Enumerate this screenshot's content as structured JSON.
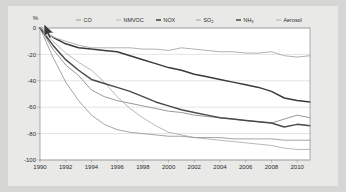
{
  "chart_data": {
    "type": "line",
    "title": "",
    "subtitle": "",
    "xlabel": "",
    "ylabel": "%",
    "ylim": [
      -100,
      0
    ],
    "xlim": [
      1990,
      2011
    ],
    "grid": true,
    "legend_position": "top",
    "y_ticks": [
      "0",
      "-20",
      "-40",
      "-60",
      "-80",
      "-100"
    ],
    "y_tick_values": [
      0,
      -20,
      -40,
      -60,
      -80,
      -100
    ],
    "x_ticks": [
      "1990",
      "1992",
      "1994",
      "1996",
      "1998",
      "2000",
      "2002",
      "2004",
      "2006",
      "2008",
      "2010"
    ],
    "x_tick_values": [
      1990,
      1992,
      1994,
      1996,
      1998,
      2000,
      2002,
      2004,
      2006,
      2008,
      2010
    ],
    "x": [
      1990,
      1991,
      1992,
      1993,
      1994,
      1995,
      1996,
      1997,
      1998,
      1999,
      2000,
      2001,
      2002,
      2003,
      2004,
      2005,
      2006,
      2007,
      2008,
      2009,
      2010,
      2011
    ],
    "series": [
      {
        "name": "CO",
        "color": "#8c8c8c",
        "width": 0.9,
        "values": [
          0,
          -16,
          -28,
          -36,
          -47,
          -52,
          -55,
          -57,
          -59,
          -61,
          -63,
          -64,
          -66,
          -67,
          -68,
          -69,
          -70,
          -71,
          -72,
          -69,
          -66,
          -68
        ]
      },
      {
        "name": "NMVOC",
        "color": "#b0b0b0",
        "width": 0.9,
        "values": [
          0,
          -10,
          -19,
          -26,
          -32,
          -41,
          -52,
          -61,
          -68,
          -74,
          -79,
          -81,
          -83,
          -84,
          -85,
          -86,
          -87,
          -88,
          -89,
          -91,
          -92,
          -92
        ]
      },
      {
        "name": "NOX",
        "color": "#3a3a3a",
        "width": 1.5,
        "values": [
          0,
          -7,
          -12,
          -15,
          -16,
          -17,
          -18,
          -21,
          -24,
          -27,
          -30,
          -32,
          -35,
          -37,
          -39,
          -41,
          -43,
          -45,
          -48,
          -53,
          -55,
          -56
        ]
      },
      {
        "name": "SO2",
        "color": "#9a9a9a",
        "width": 0.9,
        "values": [
          0,
          -22,
          -41,
          -55,
          -66,
          -73,
          -77,
          -79,
          -80,
          -81,
          -82,
          -82,
          -83,
          -83,
          -83,
          -84,
          -84,
          -84,
          -84,
          -85,
          -85,
          -85
        ]
      },
      {
        "name": "NH3",
        "color": "#4a4a4a",
        "width": 1.5,
        "values": [
          0,
          -13,
          -24,
          -32,
          -39,
          -42,
          -45,
          -48,
          -52,
          -56,
          -59,
          -62,
          -64,
          -66,
          -68,
          -69,
          -70,
          -71,
          -72,
          -75,
          -73,
          -74
        ]
      },
      {
        "name": "Aerosol",
        "color": "#a8a8a8",
        "width": 0.9,
        "values": [
          0,
          -7,
          -10,
          -13,
          -15,
          -15,
          -15,
          -15,
          -16,
          -16,
          -17,
          -15,
          -16,
          -17,
          -18,
          -18,
          -19,
          -19,
          -18,
          -21,
          -22,
          -21
        ]
      }
    ]
  },
  "legend": {
    "items": [
      {
        "label": "CO",
        "sub": "",
        "marker_color": "#8c8c8c",
        "bold": false
      },
      {
        "label": "NMVOC",
        "sub": "",
        "marker_color": "#b0b0b0",
        "bold": false
      },
      {
        "label": "NOX",
        "sub": "",
        "marker_color": "#3a3a3a",
        "bold": true
      },
      {
        "label": "SO",
        "sub": "2",
        "marker_color": "#9a9a9a",
        "bold": false
      },
      {
        "label": "NH",
        "sub": "3",
        "marker_color": "#4a4a4a",
        "bold": true
      },
      {
        "label": "Aerosol",
        "sub": "",
        "marker_color": "#a8a8a8",
        "bold": false
      }
    ]
  },
  "axis": {
    "unit_label": "%"
  },
  "colors": {
    "page_background": "#d6d6d4",
    "card_background": "#e9e9e7",
    "plot_background": "#ffffff",
    "grid": "#c8c8c8",
    "frame": "#8a8a8a",
    "text": "#2b2b2b"
  }
}
